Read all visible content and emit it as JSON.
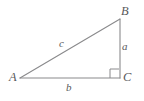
{
  "diagram": {
    "background_color": "#ffffff",
    "stroke_color": "#8a8a8c",
    "text_color": "#59595b",
    "vertices": [
      {
        "name": "A",
        "label": "A",
        "x": 20,
        "y": 78
      },
      {
        "name": "B",
        "label": "B",
        "x": 120,
        "y": 19
      },
      {
        "name": "C",
        "label": "C",
        "x": 120,
        "y": 78
      }
    ],
    "sides": [
      {
        "name": "a",
        "label": "a",
        "from": "B",
        "to": "C",
        "orientation": "vertical"
      },
      {
        "name": "b",
        "label": "b",
        "from": "A",
        "to": "C",
        "orientation": "horizontal"
      },
      {
        "name": "c",
        "label": "c",
        "from": "A",
        "to": "B",
        "orientation": "hypotenuse"
      }
    ],
    "right_angle": {
      "at_vertex": "C",
      "marker": "square",
      "size": 9
    }
  }
}
